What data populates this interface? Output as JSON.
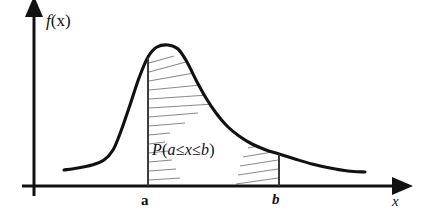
{
  "figure": {
    "title_text": "",
    "axes": {
      "y_label": "f (x)",
      "y_label_function": "f",
      "y_label_arg": "(x)",
      "x_label": "x"
    },
    "tick_labels": {
      "a": "a",
      "b": "b"
    },
    "annotation": {
      "full_text": "P(a ≤ x ≤ b)",
      "p_symbol": "P",
      "open_paren": "(",
      "lower_bound": "a",
      "rel_left": "≤",
      "variable": "x",
      "rel_right": "≤",
      "upper_bound": "b",
      "close_paren": ")"
    },
    "colors": {
      "curve": "#111111",
      "axis": "#111111",
      "hatch": "#8a8a8a",
      "boundary_line": "#333333",
      "background": "#ffffff"
    }
  },
  "chart_data": {
    "type": "area",
    "title": "",
    "xlabel": "x",
    "ylabel": "f (x)",
    "grid": false,
    "legend": false,
    "xlim": [
      0,
      421
    ],
    "ylim": [
      0,
      218
    ],
    "shaded_interval": {
      "lower_label": "a",
      "upper_label": "b",
      "lower_x_px": 148,
      "upper_x_px": 279,
      "area_label": "P(a ≤ x ≤ b)"
    },
    "axis_geometry": {
      "baseline_y_px": 186,
      "y_axis_x_px": 34,
      "x_axis_start_px": 22,
      "x_axis_arrow_tip_px": 402,
      "y_axis_arrow_tip_px": 8
    },
    "curve_points_px": [
      [
        64,
        170
      ],
      [
        78,
        168
      ],
      [
        92,
        165
      ],
      [
        104,
        160
      ],
      [
        113,
        150
      ],
      [
        121,
        131
      ],
      [
        130,
        105
      ],
      [
        139,
        78
      ],
      [
        148,
        57
      ],
      [
        157,
        47
      ],
      [
        168,
        45
      ],
      [
        178,
        49
      ],
      [
        187,
        62
      ],
      [
        196,
        80
      ],
      [
        206,
        98
      ],
      [
        216,
        113
      ],
      [
        227,
        126
      ],
      [
        239,
        136
      ],
      [
        252,
        144
      ],
      [
        266,
        150
      ],
      [
        279,
        154
      ],
      [
        295,
        159
      ],
      [
        312,
        164
      ],
      [
        330,
        168
      ],
      [
        348,
        171
      ],
      [
        365,
        172
      ]
    ],
    "curve_points_normalized": {
      "note": "y normalized so baseline=0 and peak=1",
      "x": [
        0.0,
        0.05,
        0.09,
        0.13,
        0.16,
        0.19,
        0.22,
        0.25,
        0.28,
        0.31,
        0.35,
        0.38,
        0.41,
        0.44,
        0.47,
        0.51,
        0.54,
        0.58,
        0.62,
        0.67,
        0.71,
        0.77,
        0.82,
        0.88,
        0.94,
        1.0
      ],
      "y": [
        0.11,
        0.13,
        0.15,
        0.18,
        0.26,
        0.39,
        0.57,
        0.77,
        0.91,
        0.99,
        1.0,
        0.97,
        0.88,
        0.75,
        0.62,
        0.52,
        0.43,
        0.35,
        0.3,
        0.26,
        0.23,
        0.19,
        0.16,
        0.13,
        0.11,
        0.1
      ]
    },
    "hatch_lines_px": [
      {
        "x1": 149,
        "y1": 63,
        "x2": 174,
        "y2": 56
      },
      {
        "x1": 149,
        "y1": 72,
        "x2": 186,
        "y2": 62
      },
      {
        "x1": 149,
        "y1": 81,
        "x2": 194,
        "y2": 73
      },
      {
        "x1": 149,
        "y1": 90,
        "x2": 201,
        "y2": 85
      },
      {
        "x1": 149,
        "y1": 99,
        "x2": 208,
        "y2": 95
      },
      {
        "x1": 149,
        "y1": 108,
        "x2": 214,
        "y2": 104
      },
      {
        "x1": 149,
        "y1": 117,
        "x2": 198,
        "y2": 113
      },
      {
        "x1": 149,
        "y1": 126,
        "x2": 185,
        "y2": 123
      },
      {
        "x1": 149,
        "y1": 135,
        "x2": 170,
        "y2": 133
      },
      {
        "x1": 149,
        "y1": 144,
        "x2": 165,
        "y2": 142
      },
      {
        "x1": 149,
        "y1": 153,
        "x2": 168,
        "y2": 151
      },
      {
        "x1": 149,
        "y1": 162,
        "x2": 172,
        "y2": 160
      },
      {
        "x1": 149,
        "y1": 171,
        "x2": 176,
        "y2": 169
      },
      {
        "x1": 149,
        "y1": 180,
        "x2": 180,
        "y2": 178
      },
      {
        "x1": 248,
        "y1": 148,
        "x2": 278,
        "y2": 142
      },
      {
        "x1": 243,
        "y1": 157,
        "x2": 278,
        "y2": 151
      },
      {
        "x1": 240,
        "y1": 166,
        "x2": 278,
        "y2": 160
      },
      {
        "x1": 238,
        "y1": 175,
        "x2": 278,
        "y2": 169
      },
      {
        "x1": 236,
        "y1": 184,
        "x2": 278,
        "y2": 178
      }
    ]
  }
}
